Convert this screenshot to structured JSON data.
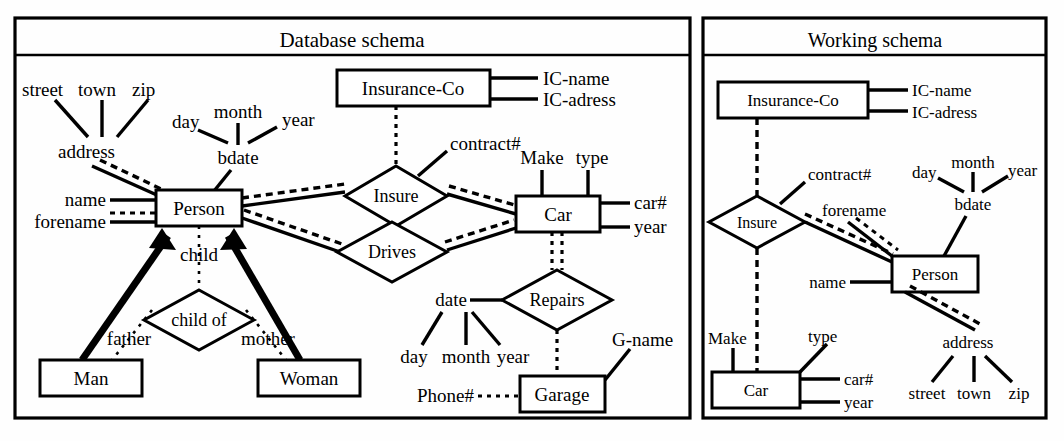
{
  "figure": {
    "type": "er-diagram-pair",
    "background": "#ffffff",
    "ink": "#000000"
  },
  "panels": {
    "left": {
      "title": "Database schema",
      "entities": [
        {
          "id": "person",
          "label": "Person"
        },
        {
          "id": "insurance_co",
          "label": "Insurance-Co"
        },
        {
          "id": "car",
          "label": "Car"
        },
        {
          "id": "man",
          "label": "Man"
        },
        {
          "id": "woman",
          "label": "Woman"
        },
        {
          "id": "garage",
          "label": "Garage"
        }
      ],
      "relationships": [
        {
          "id": "insure",
          "label": "Insure"
        },
        {
          "id": "drives",
          "label": "Drives"
        },
        {
          "id": "child_of",
          "label": "child of"
        },
        {
          "id": "repairs",
          "label": "Repairs"
        }
      ],
      "attributes": [
        {
          "id": "street",
          "label": "street",
          "owner": "address"
        },
        {
          "id": "town",
          "label": "town",
          "owner": "address"
        },
        {
          "id": "zip",
          "label": "zip",
          "owner": "address"
        },
        {
          "id": "address",
          "label": "address",
          "owner": "person"
        },
        {
          "id": "day",
          "label": "day",
          "owner": "bdate"
        },
        {
          "id": "month",
          "label": "month",
          "owner": "bdate"
        },
        {
          "id": "year",
          "label": "year",
          "owner": "bdate"
        },
        {
          "id": "bdate",
          "label": "bdate",
          "owner": "person"
        },
        {
          "id": "name",
          "label": "name",
          "owner": "person"
        },
        {
          "id": "forename",
          "label": "forename",
          "owner": "person"
        },
        {
          "id": "ic_name",
          "label": "IC-name",
          "owner": "insurance_co"
        },
        {
          "id": "ic_adress",
          "label": "IC-adress",
          "owner": "insurance_co"
        },
        {
          "id": "contract_num",
          "label": "contract#",
          "owner": "insure"
        },
        {
          "id": "make",
          "label": "Make",
          "owner": "car"
        },
        {
          "id": "type",
          "label": "type",
          "owner": "car"
        },
        {
          "id": "car_num",
          "label": "car#",
          "owner": "car"
        },
        {
          "id": "car_year",
          "label": "year",
          "owner": "car"
        },
        {
          "id": "rep_date",
          "label": "date",
          "owner": "repairs"
        },
        {
          "id": "rep_day",
          "label": "day",
          "owner": "rep_date"
        },
        {
          "id": "rep_month",
          "label": "month",
          "owner": "rep_date"
        },
        {
          "id": "rep_year",
          "label": "year",
          "owner": "rep_date"
        },
        {
          "id": "g_name",
          "label": "G-name",
          "owner": "garage"
        },
        {
          "id": "phone_num",
          "label": "Phone#",
          "owner": "garage"
        }
      ],
      "role_labels": [
        {
          "id": "child",
          "label": "child"
        },
        {
          "id": "father",
          "label": "father"
        },
        {
          "id": "mother",
          "label": "mother"
        }
      ]
    },
    "right": {
      "title": "Working schema",
      "entities": [
        {
          "id": "w_insurance_co",
          "label": "Insurance-Co"
        },
        {
          "id": "w_person",
          "label": "Person"
        },
        {
          "id": "w_car",
          "label": "Car"
        }
      ],
      "relationships": [
        {
          "id": "w_insure",
          "label": "Insure"
        }
      ],
      "attributes": [
        {
          "id": "w_ic_name",
          "label": "IC-name",
          "owner": "w_insurance_co"
        },
        {
          "id": "w_ic_adress",
          "label": "IC-adress",
          "owner": "w_insurance_co"
        },
        {
          "id": "w_contract_num",
          "label": "contract#",
          "owner": "w_insure"
        },
        {
          "id": "w_day",
          "label": "day",
          "owner": "w_bdate"
        },
        {
          "id": "w_month",
          "label": "month",
          "owner": "w_bdate"
        },
        {
          "id": "w_year",
          "label": "year",
          "owner": "w_bdate"
        },
        {
          "id": "w_bdate",
          "label": "bdate",
          "owner": "w_person"
        },
        {
          "id": "w_forename",
          "label": "forename",
          "owner": "w_person"
        },
        {
          "id": "w_name",
          "label": "name",
          "owner": "w_person"
        },
        {
          "id": "w_address",
          "label": "address",
          "owner": "w_person"
        },
        {
          "id": "w_street",
          "label": "street",
          "owner": "w_address"
        },
        {
          "id": "w_town",
          "label": "town",
          "owner": "w_address"
        },
        {
          "id": "w_zip",
          "label": "zip",
          "owner": "w_address"
        },
        {
          "id": "w_make",
          "label": "Make",
          "owner": "w_car"
        },
        {
          "id": "w_type",
          "label": "type",
          "owner": "w_car"
        },
        {
          "id": "w_car_num",
          "label": "car#",
          "owner": "w_car"
        },
        {
          "id": "w_car_year",
          "label": "year",
          "owner": "w_car"
        }
      ]
    }
  }
}
